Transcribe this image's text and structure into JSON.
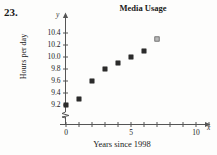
{
  "problem": {
    "number": "23."
  },
  "chart_data": {
    "type": "scatter",
    "title": "Media Usage",
    "xlabel": "Years since 1998",
    "ylabel": "Hours per day",
    "x_axis_letter": "x",
    "y_axis_letter": "y",
    "x": [
      0,
      1,
      2,
      3,
      4,
      5,
      6,
      7
    ],
    "values": [
      9.2,
      9.3,
      9.6,
      9.8,
      9.9,
      10.0,
      10.1,
      10.3
    ],
    "points": [
      {
        "x": 0,
        "y": 9.2,
        "style": "filled"
      },
      {
        "x": 1,
        "y": 9.3,
        "style": "filled"
      },
      {
        "x": 2,
        "y": 9.6,
        "style": "filled"
      },
      {
        "x": 3,
        "y": 9.8,
        "style": "filled"
      },
      {
        "x": 4,
        "y": 9.9,
        "style": "filled"
      },
      {
        "x": 5,
        "y": 10.0,
        "style": "filled"
      },
      {
        "x": 6,
        "y": 10.1,
        "style": "filled"
      },
      {
        "x": 7,
        "y": 10.3,
        "style": "open"
      }
    ],
    "xlim": [
      0,
      11
    ],
    "ylim": [
      9.1,
      10.5
    ],
    "xticks": [
      0,
      1,
      2,
      3,
      4,
      5,
      6,
      7,
      8,
      9,
      10,
      11
    ],
    "xtick_labels": [
      {
        "value": 0,
        "label": "0"
      },
      {
        "value": 5,
        "label": "5"
      },
      {
        "value": 10,
        "label": "10"
      }
    ],
    "yticks": [
      9.2,
      9.4,
      9.6,
      9.8,
      10.0,
      10.2,
      10.4
    ],
    "ytick_labels": [
      "9.2",
      "9.4",
      "9.6",
      "9.8",
      "10.0",
      "10.2",
      "10.4"
    ],
    "y_axis_break": true,
    "grid": false,
    "legend": null,
    "marker_color": "#2b2b2b",
    "axis_color": "#555555"
  }
}
